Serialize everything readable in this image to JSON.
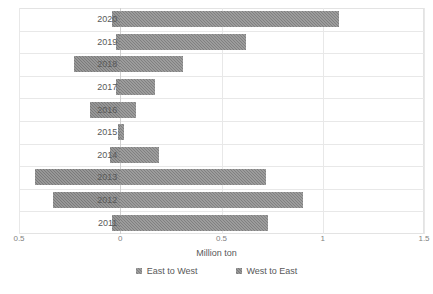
{
  "chart_data": {
    "type": "bar",
    "orientation": "horizontal",
    "stacked": true,
    "title": "",
    "xlabel": "Million ton",
    "ylabel": "",
    "xlim": [
      -0.5,
      1.5
    ],
    "xticks": [
      -0.5,
      0,
      0.5,
      1,
      1.5
    ],
    "xtick_labels": [
      "0.5",
      "0",
      "0.5",
      "1",
      "1.5"
    ],
    "grid": true,
    "legend_position": "bottom",
    "categories": [
      "2020",
      "2019",
      "2018",
      "2017",
      "2016",
      "2015",
      "2014",
      "2013",
      "2012",
      "2011"
    ],
    "series": [
      {
        "name": "East to West",
        "color": "#808080",
        "values": [
          1.08,
          0.62,
          0.31,
          0.17,
          0.08,
          0.02,
          0.19,
          0.72,
          0.9,
          0.73
        ]
      },
      {
        "name": "West to East",
        "color": "#7a7a7a",
        "values": [
          -0.04,
          -0.02,
          -0.23,
          -0.02,
          -0.15,
          -0.01,
          -0.05,
          -0.42,
          -0.33,
          -0.04
        ]
      }
    ]
  },
  "legend": {
    "items": [
      {
        "label": "East to West"
      },
      {
        "label": "West to East"
      }
    ]
  },
  "axis": {
    "x_title": "Million ton"
  }
}
